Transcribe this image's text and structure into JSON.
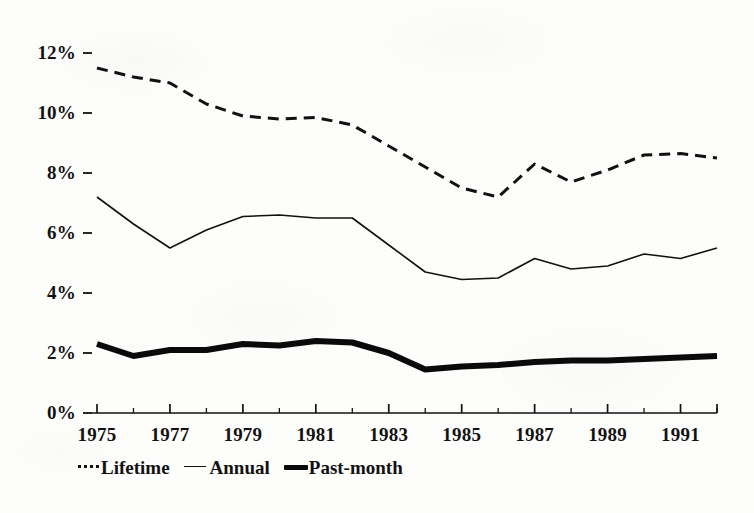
{
  "chart_data": {
    "type": "line",
    "title": "",
    "subtitle": "",
    "xlabel": "",
    "ylabel": "",
    "xlim": [
      1975,
      1992
    ],
    "ylim": [
      0,
      12
    ],
    "grid": false,
    "legend_position": "bottom-left",
    "x": [
      1975,
      1976,
      1977,
      1978,
      1979,
      1980,
      1981,
      1982,
      1983,
      1984,
      1985,
      1986,
      1987,
      1988,
      1989,
      1990,
      1991,
      1992
    ],
    "x_tick_labels": [
      "1975",
      "1977",
      "1979",
      "1981",
      "1983",
      "1985",
      "1987",
      "1989",
      "1991"
    ],
    "x_tick_values": [
      1975,
      1977,
      1979,
      1981,
      1983,
      1985,
      1987,
      1989,
      1991
    ],
    "y_tick_labels": [
      "0%",
      "2%",
      "4%",
      "6%",
      "8%",
      "10%",
      "12%"
    ],
    "y_tick_values": [
      0,
      2,
      4,
      6,
      8,
      10,
      12
    ],
    "series": [
      {
        "name": "Lifetime",
        "style": "dashed",
        "width": 3,
        "color": "#111111",
        "values": [
          11.5,
          11.2,
          11.0,
          10.3,
          9.9,
          9.8,
          9.85,
          9.6,
          8.9,
          8.2,
          7.5,
          7.2,
          8.3,
          7.7,
          8.1,
          8.6,
          8.65,
          8.5
        ]
      },
      {
        "name": "Annual",
        "style": "solid",
        "width": 1.6,
        "color": "#111111",
        "values": [
          7.2,
          6.3,
          5.5,
          6.1,
          6.55,
          6.6,
          6.5,
          6.5,
          5.6,
          4.7,
          4.45,
          4.5,
          5.15,
          4.8,
          4.9,
          5.3,
          5.15,
          5.5
        ]
      },
      {
        "name": "Past-month",
        "style": "solid",
        "width": 6,
        "color": "#0a0a0a",
        "values": [
          2.3,
          1.9,
          2.1,
          2.1,
          2.3,
          2.25,
          2.4,
          2.35,
          2.0,
          1.45,
          1.55,
          1.6,
          1.7,
          1.75,
          1.75,
          1.8,
          1.85,
          1.9
        ]
      }
    ]
  },
  "axes": {
    "y_ticks": [
      {
        "label": "12%",
        "value": 12
      },
      {
        "label": "10%",
        "value": 10
      },
      {
        "label": "8%",
        "value": 8
      },
      {
        "label": "6%",
        "value": 6
      },
      {
        "label": "4%",
        "value": 4
      },
      {
        "label": "2%",
        "value": 2
      },
      {
        "label": "0%",
        "value": 0
      }
    ],
    "x_ticks": [
      {
        "label": "1975",
        "value": 1975
      },
      {
        "label": "1977",
        "value": 1977
      },
      {
        "label": "1979",
        "value": 1979
      },
      {
        "label": "1981",
        "value": 1981
      },
      {
        "label": "1983",
        "value": 1983
      },
      {
        "label": "1985",
        "value": 1985
      },
      {
        "label": "1987",
        "value": 1987
      },
      {
        "label": "1989",
        "value": 1989
      },
      {
        "label": "1991",
        "value": 1991
      }
    ]
  },
  "legend": {
    "items": [
      {
        "label": "Lifetime",
        "swatch": "dashed-line-swatch"
      },
      {
        "label": "Annual",
        "swatch": "thin-line-swatch"
      },
      {
        "label": "Past-month",
        "swatch": "thick-line-swatch"
      }
    ]
  },
  "colors": {
    "ink": "#111111",
    "paper": "#fdfdfb"
  }
}
